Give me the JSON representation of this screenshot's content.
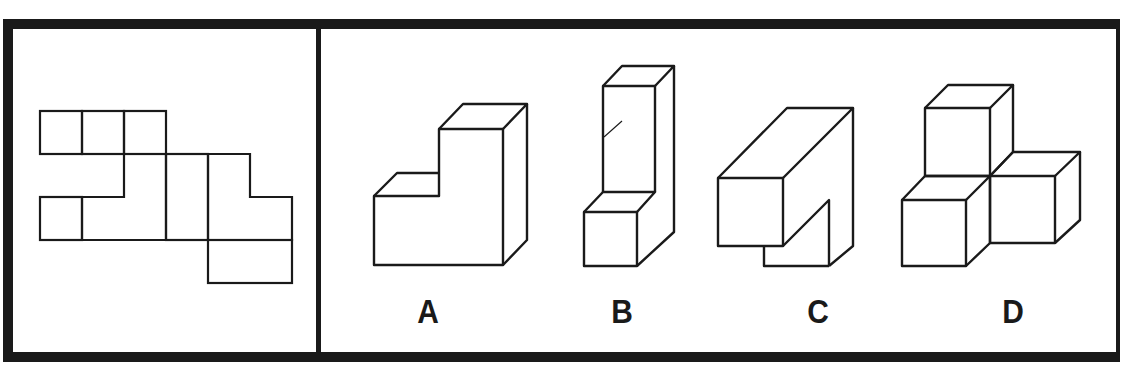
{
  "puzzle": {
    "type": "cube-net-folding",
    "question_panel": {
      "description": "unfolded net of a 3D shape"
    },
    "options": [
      {
        "label": "A",
        "description": "L-shaped stepped block"
      },
      {
        "label": "B",
        "description": "tall column with small cube in front"
      },
      {
        "label": "C",
        "description": "tilted long block with notch"
      },
      {
        "label": "D",
        "description": "three cubes arranged in L corner"
      }
    ]
  },
  "colors": {
    "frame": "#1a1a1a",
    "line": "#1a1a1a",
    "background": "#ffffff"
  }
}
